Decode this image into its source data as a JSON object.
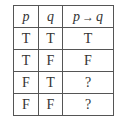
{
  "table": {
    "headers": [
      {
        "var": "p"
      },
      {
        "var": "q"
      },
      {
        "lhs": "p",
        "op": "→",
        "rhs": "q"
      }
    ],
    "rows": [
      [
        "T",
        "T",
        "T"
      ],
      [
        "T",
        "F",
        "F"
      ],
      [
        "F",
        "T",
        "?"
      ],
      [
        "F",
        "F",
        "?"
      ]
    ]
  }
}
